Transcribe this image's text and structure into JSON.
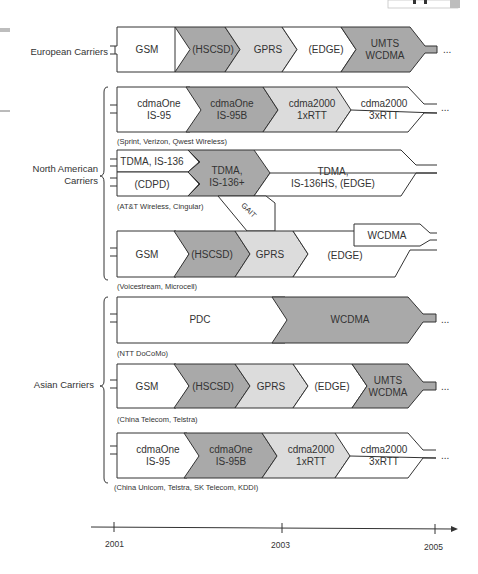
{
  "colors": {
    "white": "#ffffff",
    "dark": "#a9a9a9",
    "light": "#dcdcdc",
    "stroke": "#333333"
  },
  "groups": [
    {
      "label_lines": [
        "European Carriers"
      ]
    },
    {
      "label_lines": [
        "North American",
        "Carriers"
      ]
    },
    {
      "label_lines": [
        "Asian Carriers"
      ]
    }
  ],
  "rows": [
    {
      "id": "european",
      "segments": [
        {
          "lines": [
            "GSM"
          ],
          "fill": "white"
        },
        {
          "lines": [
            "(HSCSD)"
          ],
          "fill": "dark"
        },
        {
          "lines": [
            "GPRS"
          ],
          "fill": "light"
        },
        {
          "lines": [
            "(EDGE)"
          ],
          "fill": "white"
        },
        {
          "lines": [
            "UMTS",
            "WCDMA"
          ],
          "fill": "dark"
        }
      ],
      "continues": "..."
    },
    {
      "id": "na-cdma",
      "segments": [
        {
          "lines": [
            "cdmaOne",
            "IS-95"
          ],
          "fill": "white"
        },
        {
          "lines": [
            "cdmaOne",
            "IS-95B"
          ],
          "fill": "dark"
        },
        {
          "lines": [
            "cdma2000",
            "1xRTT"
          ],
          "fill": "light"
        },
        {
          "lines": [
            "cdma2000",
            "3xRTT"
          ],
          "fill": "white"
        }
      ],
      "carriers": "(Sprint, Verizon, Qwest Wireless)",
      "continues": "..."
    },
    {
      "id": "na-tdma",
      "segments": [
        {
          "lines": [
            "TDMA, IS-136"
          ],
          "fill": "white"
        },
        {
          "lines": [
            "(CDPD)"
          ],
          "fill": "white"
        },
        {
          "lines": [
            "TDMA,",
            "IS-136+"
          ],
          "fill": "dark"
        },
        {
          "lines": [
            "TDMA,",
            "IS-136HS, (EDGE)"
          ],
          "fill": "white"
        }
      ],
      "carriers": "(AT&T Wireless, Cingular)",
      "bridge": "GAIT"
    },
    {
      "id": "na-gsm",
      "segments": [
        {
          "lines": [
            "GSM"
          ],
          "fill": "white"
        },
        {
          "lines": [
            "(HSCSD)"
          ],
          "fill": "dark"
        },
        {
          "lines": [
            "GPRS"
          ],
          "fill": "light"
        },
        {
          "lines": [
            "(EDGE)"
          ],
          "fill": "white"
        },
        {
          "lines": [
            "WCDMA"
          ],
          "fill": "white"
        }
      ],
      "carriers": "(Voicestream, Microcell)"
    },
    {
      "id": "asia-pdc",
      "segments": [
        {
          "lines": [
            "PDC"
          ],
          "fill": "white"
        },
        {
          "lines": [
            "WCDMA"
          ],
          "fill": "dark"
        }
      ],
      "carriers": "(NTT DoCoMo)",
      "continues": "..."
    },
    {
      "id": "asia-gsm",
      "segments": [
        {
          "lines": [
            "GSM"
          ],
          "fill": "white"
        },
        {
          "lines": [
            "(HSCSD)"
          ],
          "fill": "dark"
        },
        {
          "lines": [
            "GPRS"
          ],
          "fill": "light"
        },
        {
          "lines": [
            "(EDGE)"
          ],
          "fill": "white"
        },
        {
          "lines": [
            "UMTS",
            "WCDMA"
          ],
          "fill": "dark"
        }
      ],
      "carriers": "(China Telecom, Telstra)",
      "continues": "..."
    },
    {
      "id": "asia-cdma",
      "segments": [
        {
          "lines": [
            "cdmaOne",
            "IS-95"
          ],
          "fill": "white"
        },
        {
          "lines": [
            "cdmaOne",
            "IS-95B"
          ],
          "fill": "dark"
        },
        {
          "lines": [
            "cdma2000",
            "1xRTT"
          ],
          "fill": "light"
        },
        {
          "lines": [
            "cdma2000",
            "3xRTT"
          ],
          "fill": "white"
        }
      ],
      "carriers": "(China Unicom, Telstra, SK Telecom, KDDI)",
      "continues": "..."
    }
  ],
  "timeline": {
    "ticks": [
      "2001",
      "2003",
      "2005"
    ]
  }
}
